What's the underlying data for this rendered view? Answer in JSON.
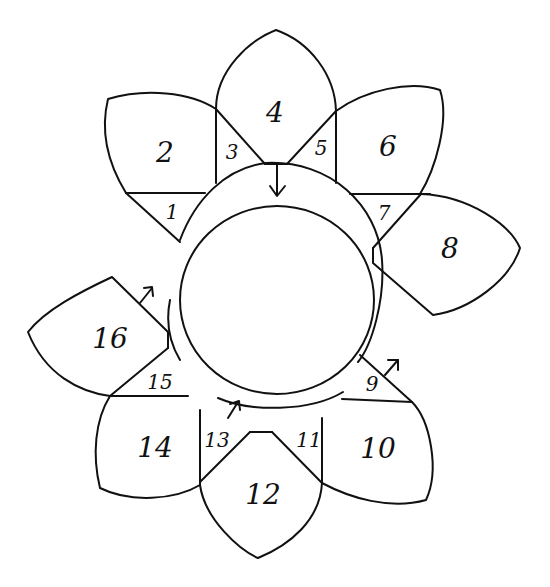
{
  "diagram": {
    "type": "flower-petal-pattern",
    "stroke_color": "#111111",
    "background": "#ffffff",
    "pieces": [
      {
        "id": 1,
        "label": "1",
        "shape": "triangle"
      },
      {
        "id": 2,
        "label": "2",
        "shape": "petal"
      },
      {
        "id": 3,
        "label": "3",
        "shape": "triangle"
      },
      {
        "id": 4,
        "label": "4",
        "shape": "petal"
      },
      {
        "id": 5,
        "label": "5",
        "shape": "triangle"
      },
      {
        "id": 6,
        "label": "6",
        "shape": "petal"
      },
      {
        "id": 7,
        "label": "7",
        "shape": "triangle"
      },
      {
        "id": 8,
        "label": "8",
        "shape": "petal"
      },
      {
        "id": 9,
        "label": "9",
        "shape": "triangle"
      },
      {
        "id": 10,
        "label": "10",
        "shape": "petal"
      },
      {
        "id": 11,
        "label": "11",
        "shape": "triangle"
      },
      {
        "id": 12,
        "label": "12",
        "shape": "petal"
      },
      {
        "id": 13,
        "label": "13",
        "shape": "triangle"
      },
      {
        "id": 14,
        "label": "14",
        "shape": "petal"
      },
      {
        "id": 15,
        "label": "15",
        "shape": "triangle"
      },
      {
        "id": 16,
        "label": "16",
        "shape": "petal"
      }
    ],
    "arrows": [
      {
        "name": "arrow-down-top",
        "direction": "down",
        "near": "4"
      },
      {
        "name": "arrow-up-right-9",
        "direction": "up-right",
        "near": "9"
      },
      {
        "name": "arrow-up-right-13",
        "direction": "up-right",
        "near": "13"
      },
      {
        "name": "arrow-up-right-16",
        "direction": "up-right",
        "near": "16"
      }
    ]
  }
}
